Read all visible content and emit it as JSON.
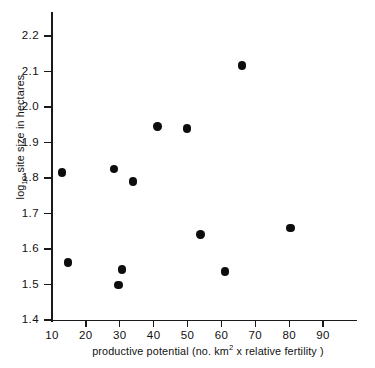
{
  "chart_data": {
    "type": "scatter",
    "title": "",
    "xlabel": "productive potential (no. km2 x relative fertility)",
    "xlabel_parts": {
      "pre": "productive  potential (no. km",
      "sup": "2",
      "post": " x relative fertility )"
    },
    "ylabel": "log10 site size in hectares",
    "ylabel_parts": {
      "pre": "log",
      "sub": "10",
      "post": " site size in hectares"
    },
    "xlim": [
      5,
      92
    ],
    "ylim": [
      1.4,
      2.24
    ],
    "xticks": [
      10,
      20,
      30,
      40,
      50,
      60,
      70,
      80,
      90
    ],
    "xticklabels": [
      "10",
      "20",
      "30",
      "40",
      "50",
      "60",
      "70",
      "80",
      "90"
    ],
    "yticks": [
      1.4,
      1.5,
      1.6,
      1.7,
      1.8,
      1.9,
      2.0,
      2.1,
      2.2
    ],
    "yticklabels": [
      "1.4",
      "1.5",
      "1.6",
      "1.7",
      "1.8",
      "1.9",
      "2.0",
      "2.1",
      "2.2"
    ],
    "grid": false,
    "legend": null,
    "marker": {
      "shape": "circle",
      "color": "#0d0d0d",
      "size_px": 8.4
    },
    "points": [
      {
        "x": 13.0,
        "y": 1.815
      },
      {
        "x": 14.8,
        "y": 1.562
      },
      {
        "x": 28.3,
        "y": 1.826
      },
      {
        "x": 29.6,
        "y": 1.498
      },
      {
        "x": 30.6,
        "y": 1.542
      },
      {
        "x": 33.9,
        "y": 1.79
      },
      {
        "x": 41.1,
        "y": 1.945
      },
      {
        "x": 49.9,
        "y": 1.939
      },
      {
        "x": 53.8,
        "y": 1.641
      },
      {
        "x": 61.0,
        "y": 1.537
      },
      {
        "x": 66.0,
        "y": 2.117
      },
      {
        "x": 80.4,
        "y": 1.66
      }
    ]
  }
}
